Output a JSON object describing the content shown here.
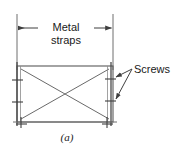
{
  "figure": {
    "caption": "(a)",
    "background_color": "#ffffff",
    "line_color": "#3f3f3f",
    "text_color": "#1a1a1a",
    "labels": {
      "metal_straps_line1": "Metal",
      "metal_straps_line2": "straps",
      "screws": "Screws"
    },
    "dimension": {
      "name": "metal-straps-width",
      "left_extension_x": 17,
      "right_extension_x": 113,
      "dimension_line_y": 28,
      "arrowheads": 2
    },
    "panel": {
      "left": 17,
      "top": 66,
      "right": 113,
      "bottom": 122,
      "has_diagonal_cross": true
    },
    "straps": [
      {
        "name": "left-strap",
        "x": 17,
        "orientation": "vertical"
      },
      {
        "name": "right-strap",
        "x": 111,
        "orientation": "vertical"
      }
    ],
    "screws": [
      {
        "name": "screw-left-upper",
        "x": 17,
        "y": 80
      },
      {
        "name": "screw-left-lower",
        "x": 17,
        "y": 102
      },
      {
        "name": "screw-right-upper",
        "x": 111,
        "y": 79
      },
      {
        "name": "screw-right-lower",
        "x": 111,
        "y": 101
      },
      {
        "name": "screw-bottom-left",
        "x": 21,
        "y": 122
      },
      {
        "name": "screw-bottom-right",
        "x": 107,
        "y": 122
      }
    ],
    "leaders": [
      {
        "name": "leader-upper",
        "from_x": 132,
        "from_y": 69,
        "to_x": 114,
        "to_y": 79
      },
      {
        "name": "leader-lower",
        "from_x": 132,
        "from_y": 69,
        "to_x": 114,
        "to_y": 101
      }
    ]
  }
}
